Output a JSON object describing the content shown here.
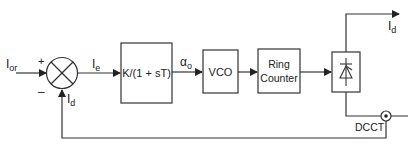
{
  "diagram": {
    "signals": {
      "reference": {
        "main": "I",
        "sub": "or"
      },
      "error": {
        "main": "I",
        "sub": "e"
      },
      "feedback": {
        "main": "I",
        "sub": "d"
      },
      "firing_angle": {
        "main": "α",
        "sub": "o"
      },
      "output": {
        "main": "I",
        "sub": "d"
      }
    },
    "junction": {
      "plus": "+",
      "minus": "–"
    },
    "blocks": {
      "controller": "K/(1 + sT)",
      "vco": "VCO",
      "ring_counter_line1": "Ring",
      "ring_counter_line2": "Counter",
      "rectifier": "rectifier"
    },
    "sensor": {
      "label": "DCCT"
    },
    "colors": {
      "line": "#333333",
      "background": "#ffffff"
    }
  }
}
